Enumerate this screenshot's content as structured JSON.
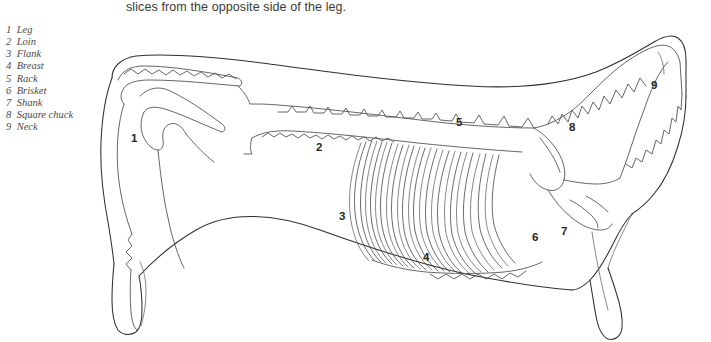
{
  "caption": {
    "text": "slices from the opposite side of the leg."
  },
  "legend": {
    "items": [
      {
        "num": "1",
        "label": "Leg"
      },
      {
        "num": "2",
        "label": "Loin"
      },
      {
        "num": "3",
        "label": "Flank"
      },
      {
        "num": "4",
        "label": "Breast"
      },
      {
        "num": "5",
        "label": "Rack"
      },
      {
        "num": "6",
        "label": "Brisket"
      },
      {
        "num": "7",
        "label": "Shank"
      },
      {
        "num": "8",
        "label": "Square chuck"
      },
      {
        "num": "9",
        "label": "Neck"
      }
    ]
  },
  "diagram": {
    "callouts": [
      {
        "num": "1",
        "x": 134,
        "y": 138,
        "cut": "Leg"
      },
      {
        "num": "2",
        "x": 317,
        "y": 143,
        "cut": "Loin"
      },
      {
        "num": "3",
        "x": 340,
        "y": 212,
        "cut": "Flank"
      },
      {
        "num": "4",
        "x": 424,
        "y": 253,
        "cut": "Breast"
      },
      {
        "num": "5",
        "x": 457,
        "y": 118,
        "cut": "Rack"
      },
      {
        "num": "6",
        "x": 533,
        "y": 233,
        "cut": "Brisket"
      },
      {
        "num": "7",
        "x": 562,
        "y": 227,
        "cut": "Shank"
      },
      {
        "num": "8",
        "x": 570,
        "y": 123,
        "cut": "Square chuck"
      },
      {
        "num": "9",
        "x": 652,
        "y": 81,
        "cut": "Neck"
      }
    ],
    "colors": {
      "background": "#ffffff",
      "outline": "#2f2f33",
      "bone": "#4b4b50",
      "rib": "#46464b",
      "caption_text": "#3a3a3a",
      "legend_text": "#4a4a4a",
      "callout_text": "#26262a"
    },
    "rib_count": 13
  }
}
